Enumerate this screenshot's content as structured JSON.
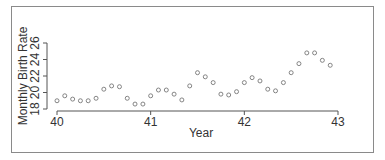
{
  "chart_data": {
    "type": "scatter",
    "title": "",
    "xlabel": "Year",
    "ylabel": "Monthly Birth Rate",
    "xlim": [
      40,
      43
    ],
    "ylim": [
      18,
      26
    ],
    "xticks": [
      40,
      41,
      42,
      43
    ],
    "yticks": [
      18,
      20,
      22,
      24,
      26
    ],
    "grid": false,
    "legend": null,
    "series": [
      {
        "name": "Monthly Birth Rate",
        "marker": "open-circle",
        "x": [
          40.0,
          40.083,
          40.167,
          40.25,
          40.333,
          40.417,
          40.5,
          40.583,
          40.667,
          40.75,
          40.833,
          40.917,
          41.0,
          41.083,
          41.167,
          41.25,
          41.333,
          41.417,
          41.5,
          41.583,
          41.667,
          41.75,
          41.833,
          41.917,
          42.0,
          42.083,
          42.167,
          42.25,
          42.333,
          42.417,
          42.5,
          42.583,
          42.667,
          42.75,
          42.833,
          42.917
        ],
        "y": [
          19.0,
          19.6,
          19.2,
          19.0,
          19.0,
          19.3,
          20.4,
          20.8,
          20.7,
          19.3,
          18.6,
          18.6,
          19.6,
          20.3,
          20.3,
          19.8,
          19.1,
          20.8,
          22.4,
          21.9,
          21.2,
          19.8,
          19.7,
          20.1,
          21.2,
          21.8,
          21.4,
          20.4,
          20.2,
          21.2,
          22.4,
          23.5,
          24.8,
          24.8,
          23.9,
          23.3
        ]
      }
    ]
  },
  "labels": {
    "x_axis_title": "Year",
    "y_axis_title": "Monthly Birth Rate",
    "x_tick_labels": [
      "40",
      "41",
      "42",
      "43"
    ],
    "y_tick_labels": [
      "18",
      "20",
      "22",
      "24",
      "26"
    ]
  },
  "colors": {
    "marker_stroke": "#777777",
    "axis": "#555555",
    "frame": "#8a8a8a",
    "text": "#333333"
  }
}
